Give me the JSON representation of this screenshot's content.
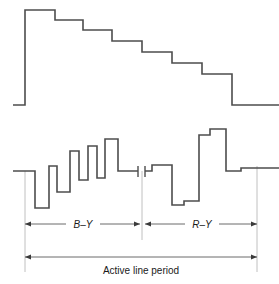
{
  "figure": {
    "title": "",
    "background_color": "#ffffff",
    "width": 279,
    "height": 284
  },
  "labels": {
    "b_y": "B–Y",
    "r_y": "R–Y",
    "active_line_period": "Active line period"
  },
  "colors": {
    "waveform_stroke": "#4d4d4d",
    "dimension_stroke": "#5a5a5a",
    "guide_stroke": "#b9b9b9",
    "text": "#1a1a1a"
  },
  "chart_data": {
    "type": "line",
    "title": "",
    "xlabel": "Active line period",
    "ylabel": "",
    "grid": false,
    "legend": null,
    "annotations": [
      {
        "text": "B–Y",
        "x_start": 25,
        "x_end": 140,
        "y": 224
      },
      {
        "text": "R–Y",
        "x_start": 145,
        "x_end": 257,
        "y": 224
      },
      {
        "text": "Active line period",
        "x_start": 25,
        "x_end": 257,
        "y": 257
      }
    ],
    "series": [
      {
        "name": "luminance-staircase",
        "note": "Descending staircase (Y / luminance signal), 7 steps",
        "baseline_y": 105,
        "points": [
          [
            13,
            105
          ],
          [
            25,
            105
          ],
          [
            25,
            10
          ],
          [
            55,
            10
          ],
          [
            55,
            20
          ],
          [
            83,
            20
          ],
          [
            83,
            30
          ],
          [
            112,
            30
          ],
          [
            112,
            41
          ],
          [
            142,
            41
          ],
          [
            142,
            52
          ],
          [
            172,
            52
          ],
          [
            172,
            63
          ],
          [
            202,
            63
          ],
          [
            202,
            74
          ],
          [
            232,
            74
          ],
          [
            232,
            105
          ],
          [
            279,
            105
          ]
        ]
      },
      {
        "name": "colour-difference-by",
        "note": "B–Y colour difference segment of the line",
        "baseline_y": 171,
        "points": [
          [
            13,
            171
          ],
          [
            25,
            171
          ],
          [
            35,
            171
          ],
          [
            35,
            208
          ],
          [
            49,
            208
          ],
          [
            49,
            166
          ],
          [
            57,
            166
          ],
          [
            57,
            192
          ],
          [
            70,
            192
          ],
          [
            70,
            151
          ],
          [
            79,
            151
          ],
          [
            79,
            180
          ],
          [
            88,
            180
          ],
          [
            88,
            146
          ],
          [
            97,
            146
          ],
          [
            97,
            178
          ],
          [
            105,
            178
          ],
          [
            105,
            139
          ],
          [
            118,
            139
          ],
          [
            118,
            171
          ],
          [
            138,
            171
          ]
        ]
      },
      {
        "name": "colour-difference-ry",
        "note": "R–Y colour difference segment of the line",
        "baseline_y": 171,
        "points": [
          [
            145,
            171
          ],
          [
            152,
            171
          ],
          [
            152,
            165
          ],
          [
            172,
            165
          ],
          [
            172,
            205
          ],
          [
            184,
            205
          ],
          [
            184,
            201
          ],
          [
            199,
            201
          ],
          [
            199,
            135
          ],
          [
            210,
            135
          ],
          [
            210,
            129
          ],
          [
            226,
            129
          ],
          [
            226,
            171
          ],
          [
            241,
            171
          ],
          [
            241,
            168
          ],
          [
            279,
            168
          ]
        ]
      }
    ],
    "markers": [
      {
        "name": "burst-gap-left-tick",
        "x": 138,
        "y1": 166,
        "y2": 177
      },
      {
        "name": "burst-gap-right-tick",
        "x": 145,
        "y1": 166,
        "y2": 177
      }
    ],
    "guides": [
      {
        "name": "left-boundary",
        "x": 25,
        "y1": 171,
        "y2": 272
      },
      {
        "name": "mid-boundary",
        "x": 142,
        "y1": 171,
        "y2": 240
      },
      {
        "name": "right-boundary",
        "x": 257,
        "y1": 168,
        "y2": 272
      }
    ]
  }
}
